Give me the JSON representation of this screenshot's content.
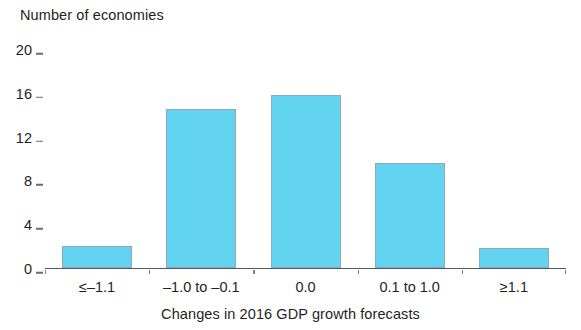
{
  "chart_data": {
    "type": "bar",
    "title": "",
    "ylabel": "Number of economies",
    "xlabel": "Changes in 2016 GDP growth forecasts",
    "categories": [
      "≤–1.1",
      "–1.0 to –0.1",
      "0.0",
      "0.1 to 1.0",
      "≥1.1"
    ],
    "values": [
      2,
      14.5,
      15.8,
      9.6,
      1.8
    ],
    "ylim": [
      0,
      20
    ],
    "yticks": [
      0,
      4,
      8,
      12,
      16,
      20
    ],
    "ytick_labels": [
      "0",
      "4",
      "8",
      "12",
      "16",
      "20"
    ],
    "grid": false,
    "legend": false,
    "bar_color": "#63d4ef",
    "bar_edge_color": "#8fa6c4",
    "axis_color": "#55585c"
  },
  "axis": {
    "y_title": "Number of economies",
    "x_title": "Changes in 2016 GDP growth forecasts"
  }
}
